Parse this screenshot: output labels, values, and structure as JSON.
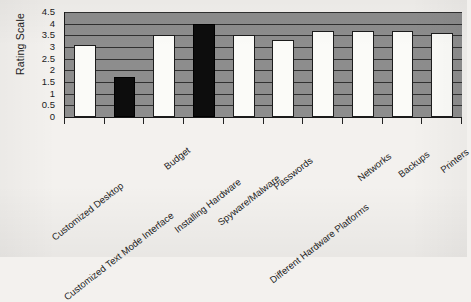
{
  "chart_data": {
    "type": "bar",
    "title": "",
    "xlabel": "",
    "ylabel": "Rating Scale",
    "ylim": [
      0,
      4.5
    ],
    "y_ticks": [
      "0",
      "0.5",
      "1",
      "1.5",
      "2",
      "2.5",
      "3",
      "3.5",
      "4",
      "4.5"
    ],
    "y_tick_values": [
      0,
      0.5,
      1,
      1.5,
      2,
      2.5,
      3,
      3.5,
      4,
      4.5
    ],
    "grid": true,
    "legend": "none",
    "categories": [
      "Customized Desktop",
      "Customized Text Mode Interface",
      "Budget",
      "Installing Hardware",
      "Spyware/Malware",
      "Passwords",
      "Different Hardware Platforms",
      "Networks",
      "Backups",
      "Printers"
    ],
    "values": [
      3.1,
      1.7,
      3.5,
      4.0,
      3.5,
      3.3,
      3.7,
      3.7,
      3.7,
      3.6
    ],
    "bar_styles": [
      "light",
      "dark",
      "light",
      "dark",
      "light",
      "light",
      "light",
      "light",
      "light",
      "light"
    ],
    "colors": {
      "plot_background": "#8d8d8d",
      "bar_light": "#fbfbf8",
      "bar_dark": "#0d0d0d",
      "axis": "#1a1a1a",
      "gridline": "#303030",
      "page_background": "#f3f1ee",
      "text": "#1c1c1c"
    }
  }
}
